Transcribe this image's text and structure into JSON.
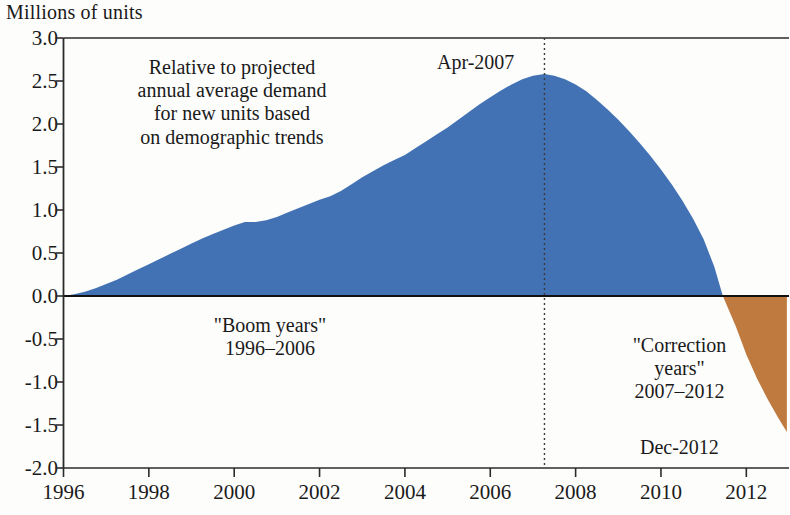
{
  "chart_data": {
    "type": "area",
    "title": "",
    "ylabel": "Millions of units",
    "xlabel": "",
    "ylim": [
      -2.0,
      3.0
    ],
    "xlim": [
      1996.0,
      2013.0
    ],
    "grid": false,
    "legend_position": "none",
    "y_ticks": [
      "3.0",
      "2.5",
      "2.0",
      "1.5",
      "1.0",
      "0.5",
      "0.0",
      "-0.5",
      "-1.0",
      "-1.5",
      "-2.0"
    ],
    "y_tick_values": [
      3.0,
      2.5,
      2.0,
      1.5,
      1.0,
      0.5,
      0.0,
      -0.5,
      -1.0,
      -1.5,
      -2.0
    ],
    "x_ticks": [
      "1996",
      "1998",
      "2000",
      "2002",
      "2004",
      "2006",
      "2008",
      "2010",
      "2012"
    ],
    "x_tick_values": [
      1996,
      1998,
      2000,
      2002,
      2004,
      2006,
      2008,
      2010,
      2012
    ],
    "series": [
      {
        "name": "Cumulative excess housing units",
        "positive_color": "#4272b4",
        "negative_color": "#bf7a40",
        "x": [
          1996.0,
          1996.25,
          1996.5,
          1996.75,
          1997.0,
          1997.25,
          1997.5,
          1997.75,
          1998.0,
          1998.25,
          1998.5,
          1998.75,
          1999.0,
          1999.25,
          1999.5,
          1999.75,
          2000.0,
          2000.25,
          2000.5,
          2000.75,
          2001.0,
          2001.25,
          2001.5,
          2001.75,
          2002.0,
          2002.25,
          2002.5,
          2002.75,
          2003.0,
          2003.25,
          2003.5,
          2003.75,
          2004.0,
          2004.25,
          2004.5,
          2004.75,
          2005.0,
          2005.25,
          2005.5,
          2005.75,
          2006.0,
          2006.25,
          2006.5,
          2006.75,
          2007.0,
          2007.27,
          2007.5,
          2007.75,
          2008.0,
          2008.25,
          2008.5,
          2008.75,
          2009.0,
          2009.25,
          2009.5,
          2009.75,
          2010.0,
          2010.25,
          2010.5,
          2010.75,
          2011.0,
          2011.25,
          2011.45,
          2011.75,
          2012.0,
          2012.25,
          2012.5,
          2012.75,
          2012.95
        ],
        "y": [
          0.0,
          0.02,
          0.05,
          0.09,
          0.14,
          0.19,
          0.25,
          0.31,
          0.37,
          0.43,
          0.49,
          0.55,
          0.61,
          0.67,
          0.72,
          0.77,
          0.82,
          0.86,
          0.86,
          0.88,
          0.92,
          0.97,
          1.02,
          1.07,
          1.12,
          1.16,
          1.22,
          1.3,
          1.38,
          1.45,
          1.52,
          1.58,
          1.64,
          1.72,
          1.8,
          1.88,
          1.96,
          2.05,
          2.14,
          2.23,
          2.31,
          2.39,
          2.46,
          2.52,
          2.56,
          2.58,
          2.56,
          2.52,
          2.46,
          2.38,
          2.28,
          2.17,
          2.05,
          1.92,
          1.78,
          1.63,
          1.47,
          1.3,
          1.11,
          0.9,
          0.66,
          0.34,
          0.0,
          -0.35,
          -0.68,
          -0.96,
          -1.2,
          -1.42,
          -1.58
        ]
      }
    ],
    "annotations": [
      {
        "id": "demand-note",
        "text": "Relative to projected\nannual average demand\nfor new units based\non demographic trends"
      },
      {
        "id": "boom-years",
        "text": "\"Boom years\"\n1996–2006"
      },
      {
        "id": "correction-years",
        "text": "\"Correction\nyears\"\n2007–2012"
      },
      {
        "id": "peak-label",
        "text": "Apr-2007",
        "x": 2007.27,
        "y": 2.58
      },
      {
        "id": "end-label",
        "text": "Dec-2012",
        "x": 2012.95,
        "y": -1.58
      }
    ],
    "marker_lines": [
      {
        "id": "apr-2007-line",
        "x": 2007.27,
        "style": "dotted"
      }
    ]
  },
  "axis": {
    "title": "Millions of units"
  },
  "labels": {
    "peak": "Apr-2007",
    "end": "Dec-2012",
    "demand_note": "Relative to projected\nannual average demand\nfor new units based\non demographic trends",
    "boom": "\"Boom years\"\n1996–2006",
    "correction": "\"Correction\nyears\"\n2007–2012"
  }
}
